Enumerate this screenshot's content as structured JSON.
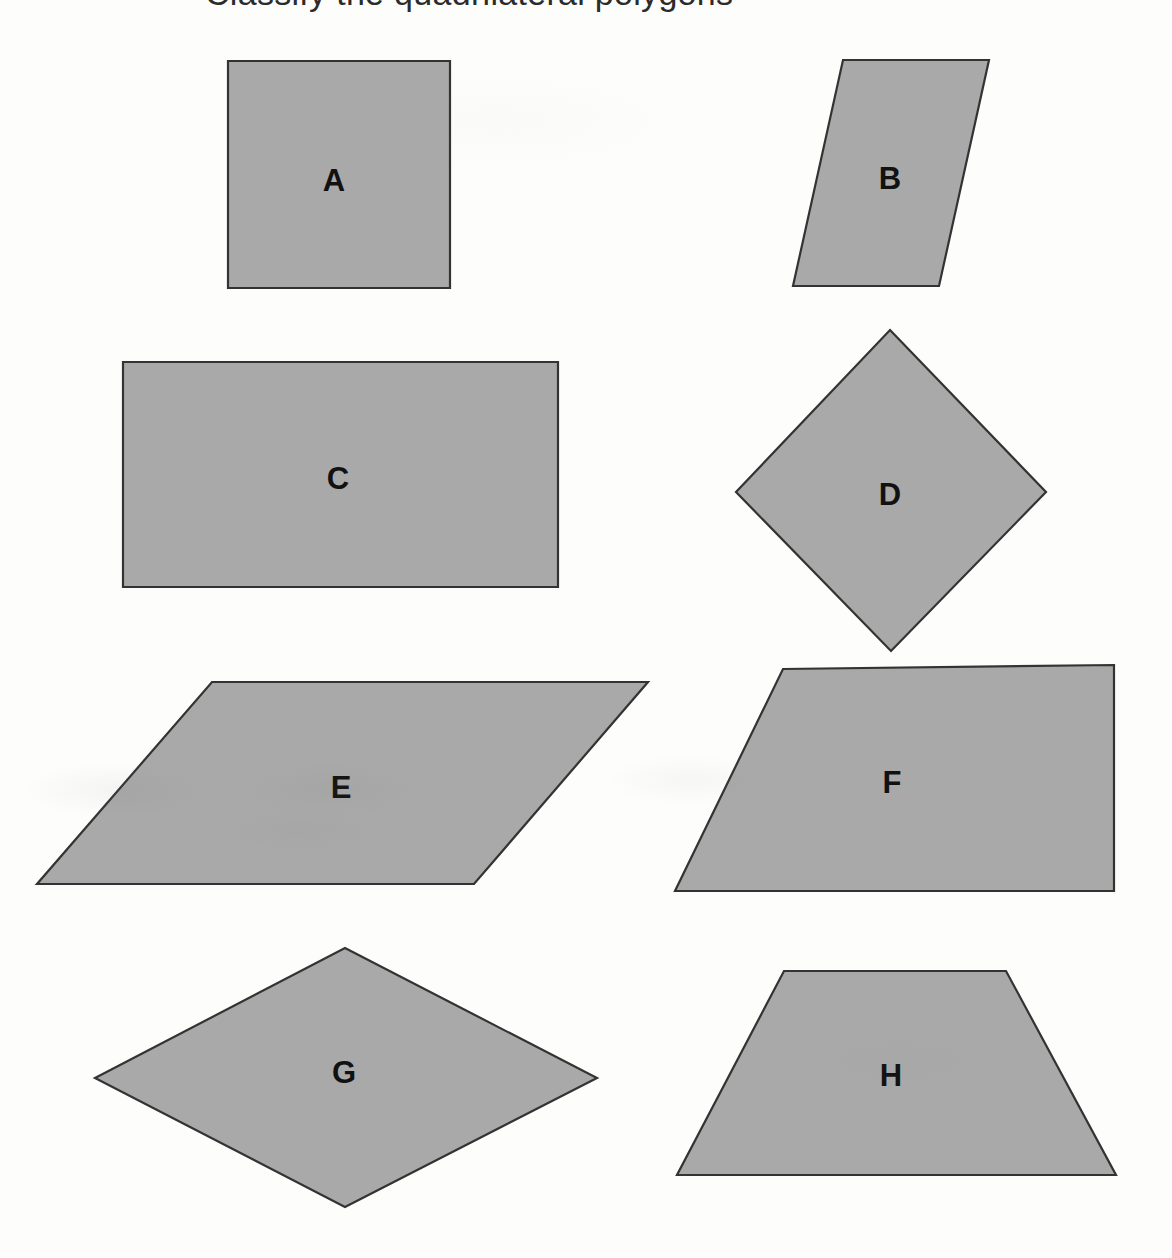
{
  "page": {
    "width": 1172,
    "height": 1258,
    "background_color": "#fdfdfc",
    "heading_partial": "Classify the quadrilateral polygons",
    "fill_color": "#a9a9a9",
    "stroke_color": "#333333",
    "label_color": "#111111"
  },
  "figure": {
    "caption": "Eight shaded quadrilaterals labeled A through H arranged in a two-column, four-row grid",
    "shape_count": 8,
    "columns": 2,
    "rows": 4
  },
  "shapes": [
    {
      "id": "A",
      "label": "A",
      "kind": "square",
      "points": "228,61 450,61 450,288 228,288",
      "label_x": 334,
      "label_y": 180
    },
    {
      "id": "B",
      "label": "B",
      "kind": "parallelogram",
      "points": "843,60 989,60 939,286 793,286",
      "label_x": 890,
      "label_y": 178
    },
    {
      "id": "C",
      "label": "C",
      "kind": "rectangle",
      "points": "123,362 558,362 558,587 123,587",
      "label_x": 338,
      "label_y": 478
    },
    {
      "id": "D",
      "label": "D",
      "kind": "rhombus",
      "points": "890,330 1046,492 891,651 736,492",
      "label_x": 890,
      "label_y": 494
    },
    {
      "id": "E",
      "label": "E",
      "kind": "parallelogram",
      "points": "212,682 648,682 474,884 37,884",
      "label_x": 341,
      "label_y": 787
    },
    {
      "id": "F",
      "label": "F",
      "kind": "trapezoid",
      "points": "783,669 1114,665 1114,891 675,891",
      "label_x": 892,
      "label_y": 782
    },
    {
      "id": "G",
      "label": "G",
      "kind": "rhombus",
      "points": "345,948 597,1078 345,1207 95,1078",
      "label_x": 344,
      "label_y": 1072
    },
    {
      "id": "H",
      "label": "H",
      "kind": "trapezoid",
      "points": "784,971 1006,971 1116,1175 677,1175",
      "label_x": 891,
      "label_y": 1075
    }
  ]
}
